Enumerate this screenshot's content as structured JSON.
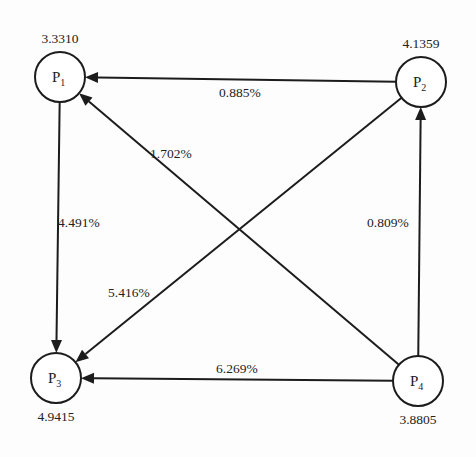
{
  "diagram": {
    "type": "directed-graph",
    "nodes": [
      {
        "id": "P1",
        "label": "P",
        "subscript": "1",
        "value": "3.3310",
        "cx": 60,
        "cy": 77,
        "r": 25,
        "value_pos": "top"
      },
      {
        "id": "P2",
        "label": "P",
        "subscript": "2",
        "value": "4.1359",
        "cx": 421,
        "cy": 82,
        "r": 25,
        "value_pos": "top"
      },
      {
        "id": "P3",
        "label": "P",
        "subscript": "3",
        "value": "4.9415",
        "cx": 56,
        "cy": 378,
        "r": 25,
        "value_pos": "bottom"
      },
      {
        "id": "P4",
        "label": "P",
        "subscript": "4",
        "value": "3.8805",
        "cx": 418,
        "cy": 381,
        "r": 25,
        "value_pos": "bottom"
      }
    ],
    "edges": [
      {
        "from": "P2",
        "to": "P1",
        "label": "0.885%",
        "label_x": 219,
        "label_y": 97
      },
      {
        "from": "P4",
        "to": "P1",
        "label": "1.702%",
        "label_x": 150,
        "label_y": 158
      },
      {
        "from": "P1",
        "to": "P3",
        "label": "4.491%",
        "label_x": 58,
        "label_y": 227
      },
      {
        "from": "P4",
        "to": "P2",
        "label": "0.809%",
        "label_x": 367,
        "label_y": 227
      },
      {
        "from": "P2",
        "to": "P3",
        "label": "5.416%",
        "label_x": 108,
        "label_y": 297
      },
      {
        "from": "P4",
        "to": "P3",
        "label": "6.269%",
        "label_x": 216,
        "label_y": 373
      }
    ]
  },
  "colors": {
    "stroke": "#1c1c1c",
    "text": "#222222",
    "background": "#fdfdfd"
  }
}
